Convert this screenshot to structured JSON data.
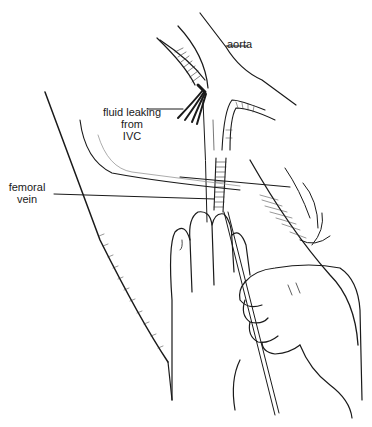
{
  "figure": {
    "labels": {
      "aorta": "aorta",
      "fluid_line1": "fluid leaking",
      "fluid_line2": "from",
      "fluid_line3": "IVC",
      "femoral_line1": "femoral",
      "femoral_line2": "vein"
    },
    "colors": {
      "ink": "#1a1a1a",
      "hatch": "#333333",
      "background": "#ffffff"
    }
  }
}
